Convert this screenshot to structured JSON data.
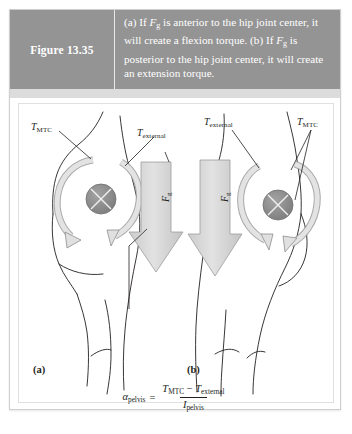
{
  "figure": {
    "number_label": "Figure 13.35",
    "caption_lines": [
      "(a) If Fg is anterior to the hip joint center,",
      "it will create a flexion torque. (b) If Fg is",
      "posterior to the hip joint center, it will",
      "create an extension torque."
    ],
    "caption_full": "(a) If Fg is anterior to the hip joint center, it will create a flexion torque. (b) If Fg is posterior to the hip joint center, it will create an extension torque."
  },
  "panels": [
    {
      "letter": "(a)",
      "labels": {
        "muscle_torque": "T",
        "muscle_torque_sub": "MTC",
        "external_torque": "T",
        "external_torque_sub": "external",
        "force": "F",
        "force_sub": "g"
      },
      "description": "Gravity force vector anterior to hip joint center producing a flexion torque"
    },
    {
      "letter": "(b)",
      "labels": {
        "external_torque": "T",
        "external_torque_sub": "external",
        "muscle_torque": "T",
        "muscle_torque_sub": "MTC",
        "force": "F",
        "force_sub": "g"
      },
      "description": "Gravity force vector posterior to hip joint center producing an extension torque"
    }
  ],
  "equation": {
    "lhs_symbol": "α",
    "lhs_sub": "pelvis",
    "equals": "=",
    "numerator_term1": "T",
    "numerator_term1_sub": "MTC",
    "minus": "−",
    "numerator_term2": "T",
    "numerator_term2_sub": "external",
    "denominator": "I",
    "denominator_sub": "pelvis",
    "plain_text": "αpelvis = (TMTC − Texternal) / Ipelvis"
  },
  "colors": {
    "header_band": "#949494",
    "header_text": "#ffffff",
    "sub_band": "#dcdcdc",
    "panel_background": "#ffffff",
    "outline": "#231f20",
    "joint_fill": "#8c8c8c",
    "arrow_fill": "#dadada",
    "arrow_stroke": "#8a8a8a",
    "card_border": "#cfcfcf"
  }
}
